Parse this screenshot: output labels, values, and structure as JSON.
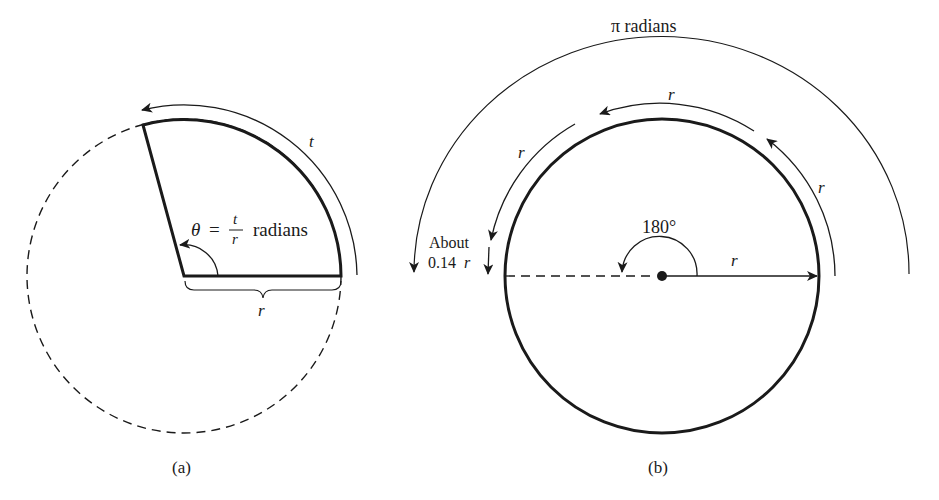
{
  "figure": {
    "panel_a": {
      "caption": "(a)",
      "arc_label": "t",
      "radius_label": "r",
      "theta_symbol": "θ",
      "equals": "=",
      "fraction_numerator": "t",
      "fraction_denominator": "r",
      "theta_unit": "radians",
      "colors": {
        "stroke": "#1a1a1a"
      }
    },
    "panel_b": {
      "caption": "(b)",
      "outer_arc_label": "π radians",
      "arc_r_top": "r",
      "arc_r_left": "r",
      "arc_r_right": "r",
      "radius_label": "r",
      "angle_label": "180°",
      "remainder_label_line1": "About",
      "remainder_label_line2_value": "0.14",
      "remainder_label_line2_var": "r",
      "colors": {
        "stroke": "#1a1a1a"
      }
    }
  }
}
